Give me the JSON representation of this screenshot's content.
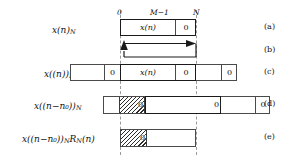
{
  "figure": {
    "axis_ticks": [
      {
        "id": "tick-0",
        "text": "0"
      },
      {
        "id": "tick-m1",
        "text": "M−1"
      },
      {
        "id": "tick-n",
        "text": "N"
      }
    ],
    "rows": [
      {
        "id": "a",
        "marker": "(a)",
        "label_html": "x(n)",
        "label_sub": "N",
        "cells": [
          {
            "text": "x(n)",
            "kind": "signal"
          },
          {
            "text": "0",
            "kind": "zero"
          }
        ]
      },
      {
        "id": "b",
        "marker": "(b)",
        "label_html": "",
        "label_sub": "",
        "icon": "circular-shift-arrow"
      },
      {
        "id": "c",
        "marker": "(c)",
        "label_html": "x((n))",
        "label_sub": "N",
        "cells": [
          {
            "text": "",
            "kind": "blank"
          },
          {
            "text": "0",
            "kind": "zero"
          },
          {
            "text": "x(n)",
            "kind": "signal"
          },
          {
            "text": "0",
            "kind": "zero"
          },
          {
            "text": "",
            "kind": "blank"
          },
          {
            "text": "0",
            "kind": "zero"
          }
        ]
      },
      {
        "id": "d",
        "marker": "(d)",
        "label_html": "x((n−n₀))",
        "label_sub": "N",
        "cells": [
          {
            "text": "",
            "kind": "blank"
          },
          {
            "text": "0",
            "kind": "hatched-zero"
          },
          {
            "text": "",
            "kind": "blank"
          },
          {
            "text": "0",
            "kind": "hatched-zero"
          },
          {
            "text": "",
            "kind": "blank"
          },
          {
            "text": "0",
            "kind": "zero"
          }
        ]
      },
      {
        "id": "e",
        "marker": "(e)",
        "label_html": "x((n−n₀))",
        "label_sub": "N",
        "label_tail": "R",
        "label_tail_sub": "N",
        "label_tail2": "(n)",
        "cells": [
          {
            "text": "0",
            "kind": "hatched-zero"
          },
          {
            "text": "",
            "kind": "blank"
          }
        ]
      }
    ],
    "colors": {
      "ink": "#111111",
      "box_border": "#4a4a4a",
      "box_border_strong": "#1a1a1a",
      "guide": "#9a9a9a",
      "hatch": "#2b2b2b",
      "background": "#ffffff"
    }
  }
}
